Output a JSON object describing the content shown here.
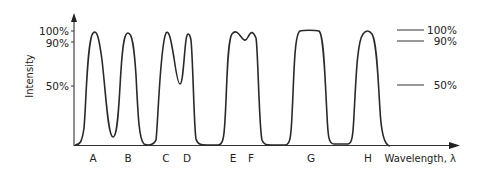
{
  "diagram": {
    "y_axis_label": "Intensity",
    "x_axis_label": "Wavelength, λ",
    "y_ticks": [
      {
        "label": "100%",
        "y": 31
      },
      {
        "label": "90%",
        "y": 42
      },
      {
        "label": "50%",
        "y": 86
      }
    ],
    "ref_lines": [
      {
        "label": "100%",
        "y": 30
      },
      {
        "label": "90%",
        "y": 41
      },
      {
        "label": "50%",
        "y": 85
      }
    ],
    "peak_labels": [
      {
        "label": "A",
        "x": 93
      },
      {
        "label": "B",
        "x": 128
      },
      {
        "label": "C",
        "x": 166
      },
      {
        "label": "D",
        "x": 187
      },
      {
        "label": "E",
        "x": 233
      },
      {
        "label": "F",
        "x": 251
      },
      {
        "label": "G",
        "x": 311
      },
      {
        "label": "H",
        "x": 368
      }
    ],
    "stroke_color": "#2a2a2a",
    "background": "#ffffff"
  }
}
